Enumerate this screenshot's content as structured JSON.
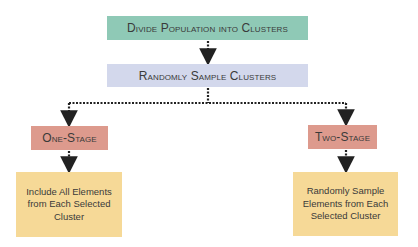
{
  "colors": {
    "step1": "#8fc9b6",
    "step2": "#d3d8ec",
    "stage": "#dd9a8d",
    "note": "#f6d997",
    "connector": "#222222"
  },
  "nodes": {
    "divide": "Divide Population into Clusters",
    "sample": "Randomly Sample Clusters",
    "one_stage": "One-Stage",
    "two_stage": "Two-Stage",
    "one_stage_note": "Include All Elements from Each Selected Cluster",
    "two_stage_note": "Randomly Sample Elements from Each Selected Cluster"
  }
}
